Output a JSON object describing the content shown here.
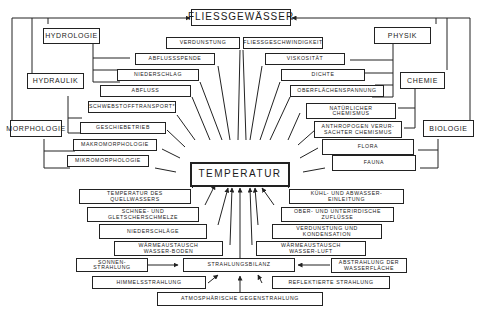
{
  "title": "FLIESSGEWÄSSER",
  "center": "TEMPERATUR",
  "categories": {
    "hydrologie": "HYDROLOGIE",
    "hydraulik": "HYDRAULIK",
    "morphologie": "MORPHOLOGIE",
    "physik": "PHYSIK",
    "chemie": "CHEMIE",
    "biologie": "BIOLOGIE"
  },
  "left_factors": [
    "VERDUNSTUNG",
    "ABFLUSSSPENDE",
    "NIEDERSCHLAG",
    "ABFLUSS",
    "SCHWEBSTOFFTRANSPORT*",
    "GESCHIEBETRIEB",
    "MAKROMORPHOLOGIE",
    "MIKROMORPHOLOGIE"
  ],
  "right_factors": [
    "FLIESSGESCHWINDIGKEIT",
    "VISKOSITÄT",
    "DICHTE",
    "OBERFLÄCHENSPANNUNG",
    "NATÜRLICHER\nCHEMISMUS",
    "ANTHROPOGEN VERUR-\nSACHTER CHEMISMUS",
    "FLORA",
    "FAUNA"
  ],
  "lower_left_factors": [
    "TEMPERATUR DES\nQUELLWASSERS",
    "SCHNEE- UND\nGLETSCHERSCHMELZE",
    "NIEDERSCHLÄGE",
    "WÄRMEAUSTAUSCH\nWASSER-BODEN"
  ],
  "lower_right_factors": [
    "KÜHL- UND ABWASSER-\nEINLEITUNG",
    "OBER- UND UNTERIRDISCHE\nZUFLÜSSE",
    "VERDUNSTUNG UND\nKONDENSATION",
    "WÄRMEAUSTAUSCH\nWASSER-LUFT"
  ],
  "radiation": {
    "balance": "STRAHLUNGSBILANZ",
    "solar": "SONNEN-\nSTRAHLUNG",
    "sky": "HIMMELSSTRAHLUNG",
    "atmospheric": "ATMOSPHÄRISCHE          GEGENSTRAHLUNG",
    "water_emission": "ABSTRAHLUNG DER\nWASSERFLÄCHE",
    "reflected": "REFLEKTIERTE     STRAHLUNG"
  }
}
